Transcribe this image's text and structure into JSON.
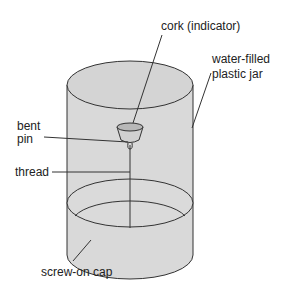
{
  "diagram": {
    "labels": {
      "cork": "cork (indicator)",
      "jar_line1": "water-filled",
      "jar_line2": "plastic jar",
      "pin_line1": "bent",
      "pin_line2": "pin",
      "thread": "thread",
      "cap": "screw-on cap"
    },
    "colors": {
      "fill": "#d9d9d9",
      "stroke": "#333333",
      "text": "#222222"
    }
  }
}
